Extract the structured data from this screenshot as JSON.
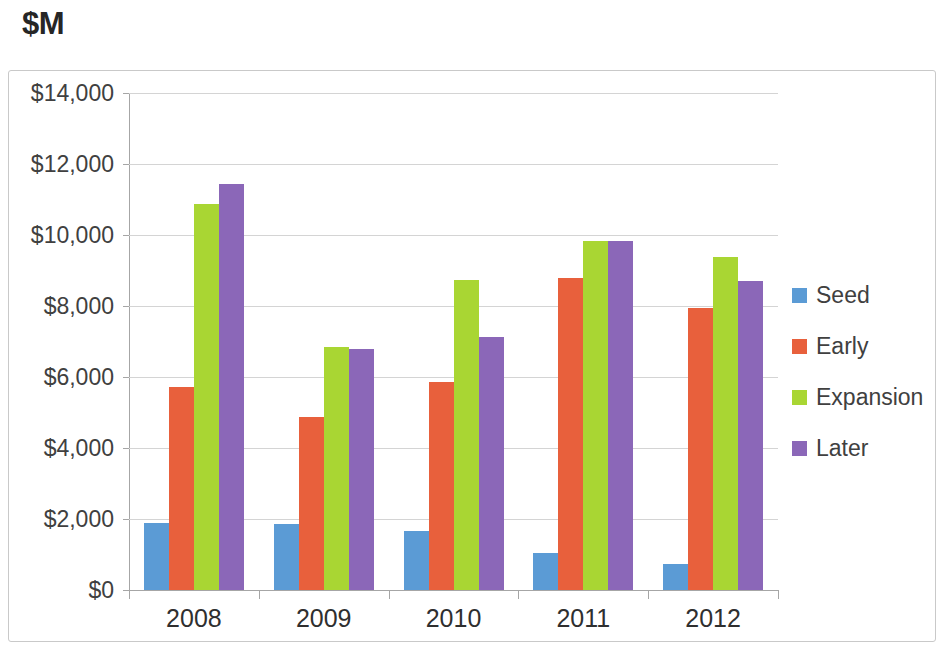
{
  "title": "$M",
  "legend": {
    "position": "right",
    "entries": [
      {
        "label": "Seed",
        "color": "#5B9BD5"
      },
      {
        "label": "Early",
        "color": "#E8603C"
      },
      {
        "label": "Expansion",
        "color": "#A9D633"
      },
      {
        "label": "Later",
        "color": "#8B67B8"
      }
    ]
  },
  "axis": {
    "y_ticks": [
      "$0",
      "$2,000",
      "$4,000",
      "$6,000",
      "$8,000",
      "$10,000",
      "$12,000",
      "$14,000"
    ],
    "x_ticks": [
      "2008",
      "2009",
      "2010",
      "2011",
      "2012"
    ]
  },
  "chart_data": {
    "type": "bar",
    "title": "$M",
    "xlabel": "",
    "ylabel": "",
    "ylim": [
      0,
      14000
    ],
    "ytick_step": 2000,
    "grid": true,
    "legend_position": "right",
    "categories": [
      "2008",
      "2009",
      "2010",
      "2011",
      "2012"
    ],
    "series": [
      {
        "name": "Seed",
        "color": "#5B9BD5",
        "values": [
          1900,
          1860,
          1670,
          1050,
          740
        ]
      },
      {
        "name": "Early",
        "color": "#E8603C",
        "values": [
          5730,
          4880,
          5860,
          8800,
          7950
        ]
      },
      {
        "name": "Expansion",
        "color": "#A9D633",
        "values": [
          10870,
          6850,
          8730,
          9840,
          9380
        ]
      },
      {
        "name": "Later",
        "color": "#8B67B8",
        "values": [
          11450,
          6800,
          7120,
          9840,
          8700
        ]
      }
    ]
  }
}
